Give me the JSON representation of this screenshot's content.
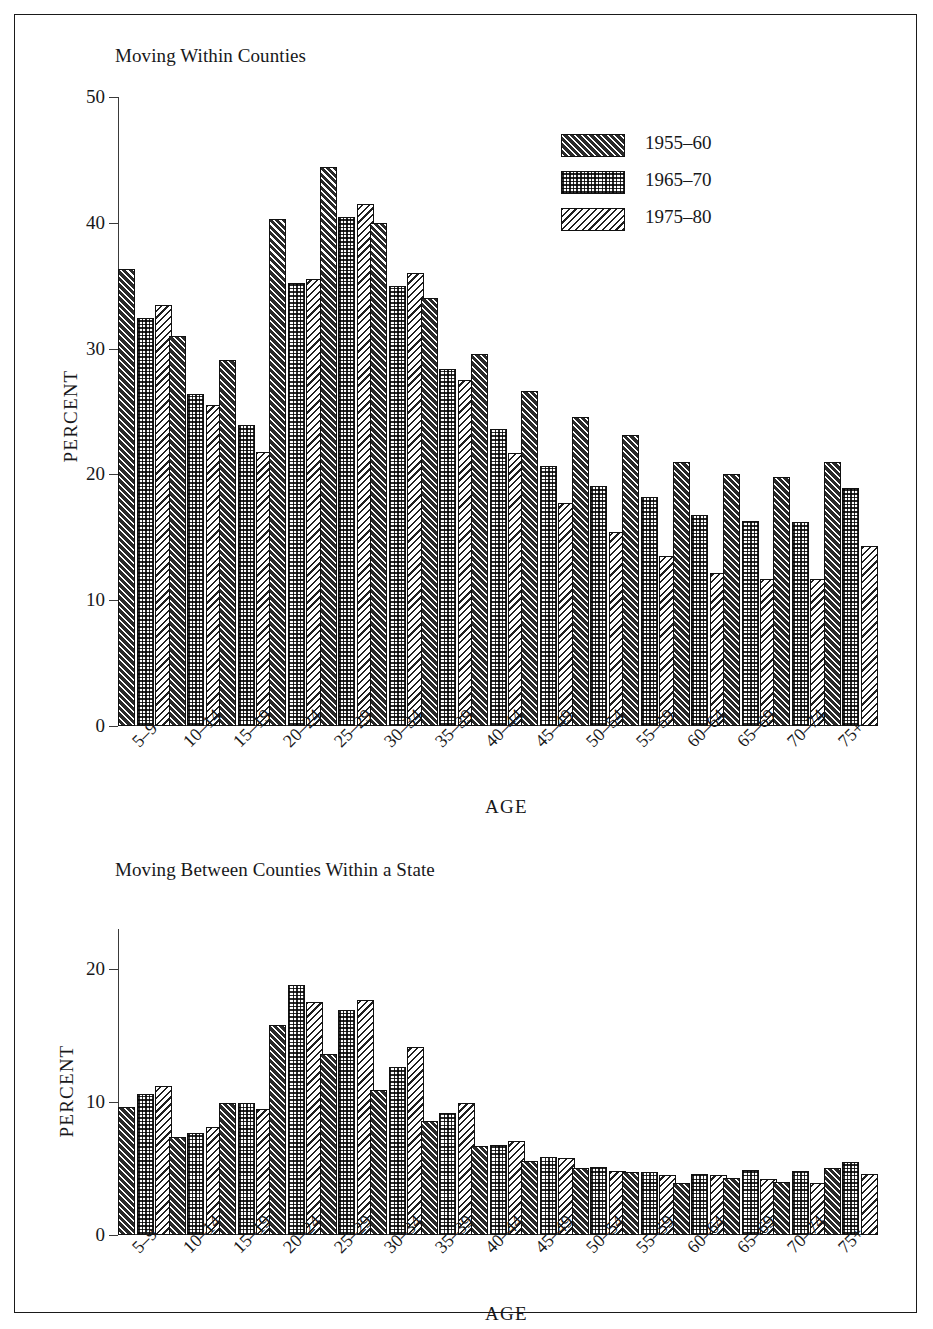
{
  "figure": {
    "series_names": [
      "1955–60",
      "1965–70",
      "1975–80"
    ],
    "categories": [
      "5–9",
      "10–14",
      "15–19",
      "20–24",
      "25–29",
      "30–34",
      "35–39",
      "40–44",
      "45–49",
      "50–54",
      "55–59",
      "60–64",
      "65–69",
      "70–74",
      "75+"
    ],
    "legend": {
      "items": [
        {
          "label": "1955–60",
          "pattern": "dark-diagonal-hatch"
        },
        {
          "label": "1965–70",
          "pattern": "dotted-checker"
        },
        {
          "label": "1975–80",
          "pattern": "light-diagonal-hatch"
        }
      ]
    }
  },
  "chart_data": [
    {
      "type": "bar",
      "title": "Moving Within Counties",
      "xlabel": "AGE",
      "ylabel": "PERCENT",
      "ylim": [
        0,
        50
      ],
      "yticks": [
        0,
        10,
        20,
        30,
        40,
        50
      ],
      "ytick_labels": [
        "0",
        "10",
        "20",
        "30",
        "40",
        "50"
      ],
      "grid": false,
      "legend_position": "top-right",
      "categories": [
        "5–9",
        "10–14",
        "15–19",
        "20–24",
        "25–29",
        "30–34",
        "35–39",
        "40–44",
        "45–49",
        "50–54",
        "55–59",
        "60–64",
        "65–69",
        "70–74",
        "75+"
      ],
      "series": [
        {
          "name": "1955–60",
          "values": [
            36.3,
            31.0,
            29.1,
            40.3,
            44.4,
            40.0,
            34.0,
            29.6,
            26.6,
            24.6,
            23.1,
            21.0,
            20.0,
            19.8,
            21.0
          ]
        },
        {
          "name": "1965–70",
          "values": [
            32.4,
            26.4,
            23.9,
            35.2,
            40.5,
            35.0,
            28.4,
            23.6,
            20.7,
            19.1,
            18.2,
            16.8,
            16.3,
            16.2,
            18.9
          ]
        },
        {
          "name": "1975–80",
          "values": [
            33.5,
            25.5,
            21.8,
            35.5,
            41.5,
            36.0,
            27.5,
            21.7,
            17.7,
            15.4,
            13.5,
            12.2,
            11.7,
            11.7,
            14.3
          ]
        }
      ]
    },
    {
      "type": "bar",
      "title": "Moving Between Counties Within a State",
      "xlabel": "AGE",
      "ylabel": "PERCENT",
      "ylim": [
        0,
        23
      ],
      "yticks": [
        0,
        10,
        20
      ],
      "ytick_labels": [
        "0",
        "10",
        "20"
      ],
      "grid": false,
      "legend_position": "none",
      "categories": [
        "5–9",
        "10–14",
        "15–19",
        "20–24",
        "25–29",
        "30–34",
        "35–39",
        "40–44",
        "45–49",
        "50–54",
        "55–59",
        "60–64",
        "65–69",
        "70–74",
        "75+"
      ],
      "series": [
        {
          "name": "1955–60",
          "values": [
            9.6,
            7.4,
            9.9,
            15.8,
            13.6,
            10.9,
            8.6,
            6.7,
            5.6,
            5.0,
            4.7,
            3.9,
            4.3,
            4.0,
            5.0
          ]
        },
        {
          "name": "1965–70",
          "values": [
            10.6,
            7.7,
            9.9,
            18.8,
            16.9,
            12.6,
            9.2,
            6.8,
            5.9,
            5.1,
            4.7,
            4.6,
            4.9,
            4.8,
            5.5
          ]
        },
        {
          "name": "1975–80",
          "values": [
            11.2,
            8.1,
            9.5,
            17.5,
            17.7,
            14.1,
            9.9,
            7.1,
            5.8,
            4.8,
            4.5,
            4.5,
            4.2,
            3.9,
            4.6
          ]
        }
      ]
    }
  ]
}
